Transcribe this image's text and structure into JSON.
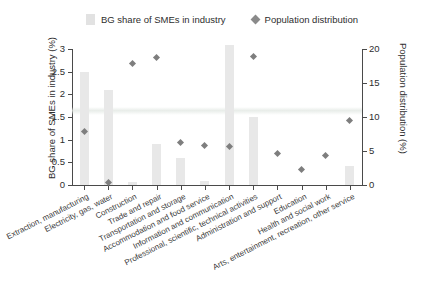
{
  "legend": {
    "position": "top-center",
    "entries": [
      {
        "label": "BG share of SMEs in industry",
        "marker": "bar-swatch-icon",
        "color": "#e2e2e2"
      },
      {
        "label": "Population distribution",
        "marker": "diamond-icon",
        "color": "#8a8a8a"
      }
    ]
  },
  "chart_data": {
    "type": "bar",
    "title": "",
    "xlabel": "",
    "ylabel": "BG share of SMEs in industry (%)",
    "y2label": "Population distribution (%)",
    "ylim": [
      0,
      3
    ],
    "y2lim": [
      0,
      20
    ],
    "yticks": [
      "0",
      "0.5",
      "1",
      "1.5",
      "2",
      "2.5",
      "3"
    ],
    "ytick_values": [
      0,
      0.5,
      1,
      1.5,
      2,
      2.5,
      3
    ],
    "y2ticks": [
      "0",
      "5",
      "10",
      "15",
      "20"
    ],
    "y2tick_values": [
      0,
      5,
      10,
      15,
      20
    ],
    "grid": false,
    "categories": [
      "Extraction, manufacturing",
      "Electricity, gas, water",
      "Construction",
      "Trade and repair",
      "Transportation and storage",
      "Accommodation and food service",
      "Information and communication",
      "Professional, scientific, technical activities",
      "Administration and support",
      "Education",
      "Health and social work",
      "Arts, entertainment, recreation, other service"
    ],
    "series": [
      {
        "name": "BG share of SMEs in industry",
        "axis": "left",
        "unit": "%",
        "type": "bar",
        "color": "#e8e8e8",
        "values": [
          2.49,
          2.1,
          0.07,
          0.9,
          0.6,
          0.08,
          3.09,
          1.5,
          0.0,
          0.0,
          0.0,
          0.42
        ]
      },
      {
        "name": "Population distribution",
        "axis": "right",
        "unit": "%",
        "type": "scatter",
        "color": "#7e7e7e",
        "values": [
          7.9,
          0.4,
          17.8,
          18.7,
          6.2,
          5.8,
          5.7,
          18.9,
          4.6,
          2.3,
          4.4,
          9.5
        ]
      }
    ]
  }
}
